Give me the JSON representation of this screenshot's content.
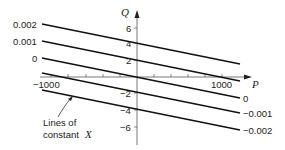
{
  "diagram": {
    "axes": {
      "x_label": "P",
      "y_label": "Q",
      "x_ticks": [
        "−1000",
        "1000"
      ],
      "y_ticks": [
        "6",
        "4",
        "2",
        "−2",
        "−4",
        "−6"
      ]
    },
    "lines": [
      {
        "label": "0.002",
        "side": "left"
      },
      {
        "label": "0.001",
        "side": "left"
      },
      {
        "label": "0",
        "side": "left"
      },
      {
        "label": "0",
        "side": "right"
      },
      {
        "label": "−0.001",
        "side": "right"
      },
      {
        "label": "−0.002",
        "side": "right"
      }
    ],
    "annotation": {
      "line1": "Lines of",
      "line2": "constant",
      "var": "X"
    }
  }
}
